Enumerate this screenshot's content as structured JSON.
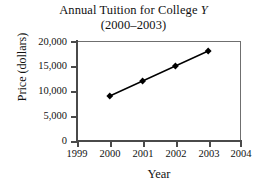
{
  "chart_data": {
    "type": "line",
    "title": "Annual Tuition for College Y",
    "title_prefix": "Annual Tuition for College ",
    "title_variable": "Y",
    "subtitle": "(2000–2003)",
    "xlabel": "Year",
    "ylabel": "Price (dollars)",
    "categories": [
      2000,
      2001,
      2002,
      2003
    ],
    "x": [
      2000,
      2001,
      2002,
      2003
    ],
    "values": [
      9000,
      12000,
      15000,
      18000
    ],
    "series": [
      {
        "name": "Annual tuition",
        "values": [
          9000,
          12000,
          15000,
          18000
        ],
        "marker": "diamond",
        "color": "#000000"
      }
    ],
    "xlim": [
      1999,
      2004
    ],
    "ylim": [
      0,
      20000
    ],
    "xticks": [
      1999,
      2000,
      2001,
      2002,
      2003,
      2004
    ],
    "xtick_labels": [
      "1999",
      "2000",
      "2001",
      "2002",
      "2003",
      "2004"
    ],
    "yticks": [
      0,
      5000,
      10000,
      15000,
      20000
    ],
    "ytick_labels": [
      "0",
      "5,000",
      "10,000",
      "15,000",
      "20,000"
    ],
    "grid": false,
    "legend": false,
    "legend_position": "none",
    "line_color": "#000000",
    "frame_color": "#6f6f6f",
    "background": "#ffffff"
  }
}
